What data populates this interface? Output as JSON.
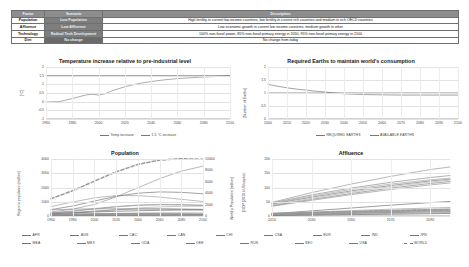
{
  "table": {
    "headers": [
      "Factor",
      "Scenario",
      "Description"
    ],
    "rows": [
      {
        "factor": "Population",
        "scenario": "Low Population",
        "description": "High fertility in current low income countries, low fertility in current rich countries and medium in rich OECD countries"
      },
      {
        "factor": "Affluence",
        "scenario": "Low Affluence",
        "description": "Low economic growth in current low income countries, medium growth in other"
      },
      {
        "factor": "Technology",
        "scenario": "Radical Tech Development",
        "description": "100% non-fossil power, 85% non-fossil primary energy in 2050, 95% non-fossil primary energy in 2100"
      },
      {
        "factor": "Diet",
        "scenario": "No change",
        "description": "No change from today"
      }
    ]
  },
  "chart_data": [
    {
      "id": "temperature",
      "type": "line",
      "title": "Temperature increase relative to pre-industrial level",
      "xlabel": "",
      "ylabel": "[°C]",
      "xlim": [
        1960,
        2100
      ],
      "ylim": [
        -1,
        2
      ],
      "xticks": [
        1960,
        1980,
        2000,
        2020,
        2040,
        2060,
        2080,
        2100
      ],
      "yticks": [
        -1,
        -0.5,
        0,
        0.5,
        1,
        1.5,
        2
      ],
      "ytick_labels": [
        "-1",
        "-0.5",
        "0",
        "0.5",
        "1",
        "1.5",
        "2"
      ],
      "grid": true,
      "legend_position": "bottom",
      "series": [
        {
          "name": "Temp increase",
          "style": "solid",
          "color": "#8a8a8a",
          "x": [
            1960,
            1970,
            1980,
            1990,
            1995,
            2000,
            2005,
            2010,
            2020,
            2030,
            2040,
            2050,
            2060,
            2070,
            2080,
            2090,
            2100
          ],
          "values": [
            -0.02,
            0.0,
            0.18,
            0.38,
            0.43,
            0.38,
            0.46,
            0.62,
            0.86,
            1.04,
            1.16,
            1.26,
            1.33,
            1.38,
            1.42,
            1.46,
            1.5
          ]
        },
        {
          "name": "1.5 °C increase",
          "style": "solid",
          "color": "#6d6d6d",
          "x": [
            1960,
            2100
          ],
          "values": [
            1.5,
            1.5
          ]
        }
      ]
    },
    {
      "id": "earths",
      "type": "line",
      "title": "Required Earths to maintain world's consumption",
      "xlabel": "",
      "ylabel": "[Number of Earths]",
      "xlim": [
        2000,
        2100
      ],
      "ylim": [
        0,
        2
      ],
      "xticks": [
        2000,
        2010,
        2020,
        2030,
        2040,
        2050,
        2060,
        2070,
        2080,
        2090,
        2100
      ],
      "yticks": [
        0,
        0.5,
        1,
        1.5,
        2
      ],
      "ytick_labels": [
        "0",
        "0.5",
        "1",
        "1.5",
        "2"
      ],
      "grid": true,
      "legend_position": "bottom",
      "series": [
        {
          "name": "REQUIRED EARTHS",
          "style": "solid",
          "color": "#7d7d7d",
          "x": [
            2000,
            2005,
            2010,
            2015,
            2020,
            2025,
            2030,
            2035,
            2040,
            2050,
            2060,
            2070,
            2080,
            2090,
            2100
          ],
          "values": [
            1.33,
            1.26,
            1.2,
            1.15,
            1.11,
            1.07,
            1.04,
            1.0,
            0.97,
            0.94,
            0.93,
            0.92,
            0.92,
            0.92,
            0.92
          ]
        },
        {
          "name": "AVAILABLE EARTHS",
          "style": "solid",
          "color": "#6a6a6a",
          "x": [
            2000,
            2100
          ],
          "values": [
            1.0,
            1.0
          ]
        }
      ]
    },
    {
      "id": "population",
      "type": "line",
      "title": "Population",
      "xlabel": "",
      "ylabel": "Region's population [million]",
      "ylabel_right": "World's Population [million]",
      "xlim": [
        1960,
        2100
      ],
      "ylim": [
        0,
        4000
      ],
      "ylim_right": [
        0,
        10000
      ],
      "xticks": [
        1960,
        1980,
        2000,
        2020,
        2040,
        2060,
        2080,
        2100
      ],
      "yticks": [
        0,
        1000,
        2000,
        3000,
        4000
      ],
      "yticks_right": [
        0,
        2000,
        4000,
        6000,
        8000,
        10000
      ],
      "grid": true,
      "legend_position": "bottom",
      "series": [
        {
          "name": "AFR",
          "style": "solid",
          "axis": "left",
          "x": [
            1960,
            1980,
            2000,
            2020,
            2040,
            2060,
            2080,
            2100
          ],
          "values": [
            285,
            480,
            815,
            1340,
            1980,
            2620,
            3150,
            3500
          ]
        },
        {
          "name": "AUS",
          "style": "solid",
          "axis": "left",
          "x": [
            1960,
            1980,
            2000,
            2020,
            2040,
            2060,
            2080,
            2100
          ],
          "values": [
            13,
            18,
            23,
            30,
            36,
            40,
            43,
            45
          ]
        },
        {
          "name": "CAC",
          "style": "solid",
          "axis": "left",
          "x": [
            1960,
            1980,
            2000,
            2020,
            2040,
            2060,
            2080,
            2100
          ],
          "values": [
            50,
            85,
            135,
            180,
            210,
            225,
            225,
            215
          ]
        },
        {
          "name": "CAN",
          "style": "solid",
          "axis": "left",
          "x": [
            1960,
            1980,
            2000,
            2020,
            2040,
            2060,
            2080,
            2100
          ],
          "values": [
            18,
            24,
            31,
            38,
            44,
            48,
            51,
            53
          ]
        },
        {
          "name": "MEA",
          "style": "solid",
          "axis": "left",
          "x": [
            1960,
            1980,
            2000,
            2020,
            2040,
            2060,
            2080,
            2100
          ],
          "values": [
            105,
            180,
            300,
            440,
            560,
            640,
            680,
            690
          ]
        },
        {
          "name": "MEX",
          "style": "solid",
          "axis": "left",
          "x": [
            1960,
            1980,
            2000,
            2020,
            2040,
            2060,
            2080,
            2100
          ],
          "values": [
            38,
            68,
            99,
            128,
            145,
            150,
            145,
            135
          ]
        },
        {
          "name": "ODA",
          "style": "solid",
          "axis": "left",
          "x": [
            1960,
            1980,
            2000,
            2020,
            2040,
            2060,
            2080,
            2100
          ],
          "values": [
            210,
            330,
            490,
            640,
            750,
            800,
            800,
            760
          ]
        },
        {
          "name": "OEE",
          "style": "solid",
          "axis": "left",
          "x": [
            1960,
            1980,
            2000,
            2020,
            2040,
            2060,
            2080,
            2100
          ],
          "values": [
            95,
            120,
            135,
            140,
            140,
            135,
            125,
            115
          ]
        },
        {
          "name": "CHI",
          "style": "solid",
          "axis": "left",
          "x": [
            1960,
            1980,
            2000,
            2020,
            2040,
            2060,
            2080,
            2100
          ],
          "values": [
            660,
            985,
            1270,
            1430,
            1430,
            1330,
            1170,
            1020
          ]
        },
        {
          "name": "CSA",
          "style": "solid",
          "axis": "left",
          "x": [
            1960,
            1980,
            2000,
            2020,
            2040,
            2060,
            2080,
            2100
          ],
          "values": [
            145,
            240,
            350,
            440,
            495,
            510,
            495,
            465
          ]
        },
        {
          "name": "EUR",
          "style": "solid",
          "axis": "left",
          "x": [
            1960,
            1980,
            2000,
            2020,
            2040,
            2060,
            2080,
            2100
          ],
          "values": [
            425,
            485,
            500,
            510,
            500,
            480,
            455,
            430
          ]
        },
        {
          "name": "IND",
          "style": "solid",
          "axis": "left",
          "x": [
            1960,
            1980,
            2000,
            2020,
            2040,
            2060,
            2080,
            2100
          ],
          "values": [
            450,
            700,
            1050,
            1380,
            1600,
            1690,
            1660,
            1560
          ]
        },
        {
          "name": "JPN",
          "style": "solid",
          "axis": "left",
          "x": [
            1960,
            1980,
            2000,
            2020,
            2040,
            2060,
            2080,
            2100
          ],
          "values": [
            93,
            117,
            127,
            126,
            113,
            100,
            88,
            78
          ]
        },
        {
          "name": "RUS",
          "style": "solid",
          "axis": "left",
          "x": [
            1960,
            1980,
            2000,
            2020,
            2040,
            2060,
            2080,
            2100
          ],
          "values": [
            120,
            139,
            146,
            145,
            138,
            130,
            122,
            114
          ]
        },
        {
          "name": "SEO",
          "style": "solid",
          "axis": "left",
          "x": [
            1960,
            1980,
            2000,
            2020,
            2040,
            2060,
            2080,
            2100
          ],
          "values": [
            220,
            355,
            520,
            665,
            760,
            795,
            780,
            735
          ]
        },
        {
          "name": "USA",
          "style": "solid",
          "axis": "left",
          "x": [
            1960,
            1980,
            2000,
            2020,
            2040,
            2060,
            2080,
            2100
          ],
          "values": [
            186,
            228,
            282,
            331,
            370,
            398,
            418,
            433
          ]
        },
        {
          "name": "WORLD",
          "style": "dashed",
          "axis": "right",
          "x": [
            1960,
            1980,
            2000,
            2020,
            2040,
            2060,
            2080,
            2100
          ],
          "values": [
            3030,
            4450,
            6120,
            7750,
            9050,
            9800,
            10050,
            9950
          ]
        }
      ]
    },
    {
      "id": "affluence",
      "type": "line",
      "title": "Affluence",
      "xlabel": "",
      "ylabel": "(GDP (2010 kUS/capita)",
      "xlim": [
        2010,
        2100
      ],
      "ylim": [
        0,
        200
      ],
      "xticks": [
        2010,
        2030,
        2050,
        2070,
        2090
      ],
      "yticks": [
        0,
        50,
        100,
        150,
        200
      ],
      "grid": true,
      "legend_position": "bottom",
      "series": [
        {
          "name": "AUS",
          "style": "solid",
          "x": [
            2010,
            2030,
            2050,
            2070,
            2090,
            2100
          ],
          "values": [
            48,
            82,
            112,
            139,
            163,
            172
          ]
        },
        {
          "name": "USA",
          "style": "solid",
          "x": [
            2010,
            2030,
            2050,
            2070,
            2090,
            2100
          ],
          "values": [
            46,
            74,
            98,
            118,
            135,
            142
          ]
        },
        {
          "name": "CAN",
          "style": "solid",
          "x": [
            2010,
            2030,
            2050,
            2070,
            2090,
            2100
          ],
          "values": [
            44,
            70,
            93,
            112,
            127,
            133
          ]
        },
        {
          "name": "JPN",
          "style": "solid",
          "x": [
            2010,
            2030,
            2050,
            2070,
            2090,
            2100
          ],
          "values": [
            42,
            66,
            88,
            107,
            123,
            129
          ]
        },
        {
          "name": "EUR",
          "style": "solid",
          "x": [
            2010,
            2030,
            2050,
            2070,
            2090,
            2100
          ],
          "values": [
            38,
            62,
            84,
            103,
            119,
            126
          ]
        },
        {
          "name": "RUS",
          "style": "solid",
          "x": [
            2010,
            2030,
            2050,
            2070,
            2090,
            2100
          ],
          "values": [
            36,
            58,
            79,
            98,
            114,
            121
          ]
        },
        {
          "name": "OEE",
          "style": "solid",
          "x": [
            2010,
            2030,
            2050,
            2070,
            2090,
            2100
          ],
          "values": [
            34,
            55,
            75,
            93,
            109,
            116
          ]
        },
        {
          "name": "CHI",
          "style": "solid",
          "x": [
            2010,
            2030,
            2050,
            2070,
            2090,
            2100
          ],
          "values": [
            8,
            18,
            28,
            38,
            47,
            51
          ]
        },
        {
          "name": "MEX",
          "style": "solid",
          "x": [
            2010,
            2030,
            2050,
            2070,
            2090,
            2100
          ],
          "values": [
            9,
            14,
            19,
            24,
            28,
            30
          ]
        },
        {
          "name": "CSA",
          "style": "solid",
          "x": [
            2010,
            2030,
            2050,
            2070,
            2090,
            2100
          ],
          "values": [
            8,
            12,
            16,
            20,
            23,
            25
          ]
        },
        {
          "name": "CAC",
          "style": "solid",
          "x": [
            2010,
            2030,
            2050,
            2070,
            2090,
            2100
          ],
          "values": [
            7,
            11,
            15,
            18,
            21,
            23
          ]
        },
        {
          "name": "MEA",
          "style": "solid",
          "x": [
            2010,
            2030,
            2050,
            2070,
            2090,
            2100
          ],
          "values": [
            6,
            9,
            12,
            15,
            18,
            19
          ]
        },
        {
          "name": "SEO",
          "style": "solid",
          "x": [
            2010,
            2030,
            2050,
            2070,
            2090,
            2100
          ],
          "values": [
            4,
            7,
            10,
            13,
            16,
            17
          ]
        },
        {
          "name": "IND",
          "style": "solid",
          "x": [
            2010,
            2030,
            2050,
            2070,
            2090,
            2100
          ],
          "values": [
            3,
            6,
            9,
            12,
            14,
            15
          ]
        },
        {
          "name": "ODA",
          "style": "solid",
          "x": [
            2010,
            2030,
            2050,
            2070,
            2090,
            2100
          ],
          "values": [
            3,
            5,
            7,
            9,
            11,
            12
          ]
        },
        {
          "name": "AFR",
          "style": "solid",
          "x": [
            2010,
            2030,
            2050,
            2070,
            2090,
            2100
          ],
          "values": [
            2,
            3,
            5,
            6,
            8,
            9
          ]
        },
        {
          "name": "WORLD",
          "style": "dashed",
          "x": [
            2010,
            2030,
            2050,
            2070,
            2090,
            2100
          ],
          "values": [
            9,
            12,
            15,
            18,
            21,
            22
          ]
        }
      ]
    }
  ],
  "legends": {
    "temperature": [
      {
        "label": "Temp increase",
        "style": "solid"
      },
      {
        "label": "1.5 °C increase",
        "style": "solid"
      }
    ],
    "earths": [
      {
        "label": "REQUIRED EARTHS",
        "style": "solid"
      },
      {
        "label": "AVAILABLE EARTHS",
        "style": "solid"
      }
    ],
    "regions_row1": [
      "AFR",
      "AUS",
      "CAC",
      "CAN",
      "CHI",
      "CSA",
      "EUR",
      "IND",
      "JPN"
    ],
    "regions_row2": [
      "MEA",
      "MEX",
      "ODA",
      "OEE",
      "RUS",
      "SEO",
      "USA",
      "WORLD"
    ],
    "world_label": "WORLD"
  }
}
